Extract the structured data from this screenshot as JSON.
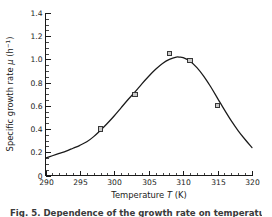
{
  "figure": {
    "caption": "Fig. 5. Dependence of the growth rate on temperature"
  },
  "chart_data": {
    "type": "line",
    "title": "",
    "xlabel": "Temperature T (K)",
    "ylabel": "Specific growth rate μ (h⁻¹)",
    "xlabel_parts": {
      "prefix": "Temperature ",
      "symbol": "T",
      "suffix": " (K)"
    },
    "ylabel_parts": {
      "prefix": "Specific growth rate ",
      "symbol": "μ",
      "unit_base": " (h",
      "unit_exp": "−1",
      "unit_close": ")"
    },
    "xlim": [
      290,
      320
    ],
    "ylim": [
      0,
      1.4
    ],
    "xticks": [
      290,
      295,
      300,
      305,
      310,
      315,
      320
    ],
    "xtick_labels": [
      "290",
      "295",
      "300",
      "305",
      "310",
      "315",
      "320"
    ],
    "yticks": [
      0,
      0.2,
      0.4,
      0.6,
      0.8,
      1.0,
      1.2,
      1.4
    ],
    "ytick_labels": [
      "0",
      "0.2",
      "0.4",
      "0.6",
      "0.8",
      "1.0",
      "1.2",
      "1.4"
    ],
    "x_minor_step": 1,
    "y_minor_step": 0.05,
    "grid": false,
    "legend": false,
    "series": [
      {
        "name": "fitted curve",
        "marker": "none",
        "x": [
          290,
          291,
          292,
          293,
          294,
          295,
          296,
          297,
          298,
          299,
          300,
          301,
          302,
          303,
          304,
          305,
          306,
          307,
          308,
          309,
          309.5,
          310,
          311,
          312,
          313,
          314,
          315,
          316,
          317,
          318,
          319,
          320
        ],
        "y": [
          0.15,
          0.17,
          0.19,
          0.21,
          0.235,
          0.26,
          0.29,
          0.335,
          0.39,
          0.45,
          0.515,
          0.585,
          0.655,
          0.72,
          0.79,
          0.855,
          0.915,
          0.965,
          1.0,
          1.02,
          1.02,
          1.015,
          0.985,
          0.93,
          0.855,
          0.765,
          0.665,
          0.565,
          0.47,
          0.385,
          0.31,
          0.24
        ]
      },
      {
        "name": "measured data",
        "marker": "open-square",
        "x": [
          298,
          303,
          308,
          311,
          315
        ],
        "y": [
          0.4,
          0.7,
          1.05,
          0.99,
          0.6
        ]
      }
    ]
  },
  "colors": {
    "ink": "#1a1a1a",
    "background": "#ffffff",
    "marker_fill": "#c9c9c9",
    "marker_stroke": "#252525",
    "caption": "#3a3a3a"
  }
}
